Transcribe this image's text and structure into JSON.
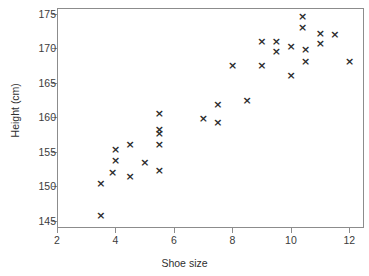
{
  "chart_data": {
    "type": "scatter",
    "title": "",
    "xlabel": "Shoe size",
    "ylabel": "Height (cm)",
    "xlim": [
      2,
      12.5
    ],
    "ylim": [
      144,
      175.8
    ],
    "xticks": [
      2,
      4,
      6,
      8,
      10,
      12
    ],
    "yticks": [
      145,
      150,
      155,
      160,
      165,
      170,
      175
    ],
    "grid": false,
    "legend": null,
    "marker": "x",
    "marker_color": "#2b2b2b",
    "axis_color": "#8c8c8c",
    "points": [
      {
        "x": 3.5,
        "y": 145.8
      },
      {
        "x": 3.5,
        "y": 150.4
      },
      {
        "x": 3.9,
        "y": 152.0
      },
      {
        "x": 4.0,
        "y": 153.8
      },
      {
        "x": 4.0,
        "y": 155.3
      },
      {
        "x": 4.5,
        "y": 151.4
      },
      {
        "x": 4.5,
        "y": 156.1
      },
      {
        "x": 5.0,
        "y": 153.5
      },
      {
        "x": 5.5,
        "y": 152.3
      },
      {
        "x": 5.5,
        "y": 156.1
      },
      {
        "x": 5.5,
        "y": 157.7
      },
      {
        "x": 5.5,
        "y": 158.2
      },
      {
        "x": 5.5,
        "y": 160.6
      },
      {
        "x": 7.0,
        "y": 159.8
      },
      {
        "x": 7.5,
        "y": 159.2
      },
      {
        "x": 7.5,
        "y": 161.8
      },
      {
        "x": 8.0,
        "y": 167.5
      },
      {
        "x": 8.5,
        "y": 162.5
      },
      {
        "x": 9.0,
        "y": 167.5
      },
      {
        "x": 9.0,
        "y": 171.0
      },
      {
        "x": 9.5,
        "y": 169.5
      },
      {
        "x": 9.5,
        "y": 171.0
      },
      {
        "x": 10.0,
        "y": 166.1
      },
      {
        "x": 10.0,
        "y": 170.3
      },
      {
        "x": 10.4,
        "y": 173.0
      },
      {
        "x": 10.4,
        "y": 174.6
      },
      {
        "x": 10.5,
        "y": 168.0
      },
      {
        "x": 10.5,
        "y": 169.8
      },
      {
        "x": 11.0,
        "y": 170.6
      },
      {
        "x": 11.0,
        "y": 172.1
      },
      {
        "x": 11.5,
        "y": 172.0
      },
      {
        "x": 12.0,
        "y": 168.0
      }
    ]
  }
}
